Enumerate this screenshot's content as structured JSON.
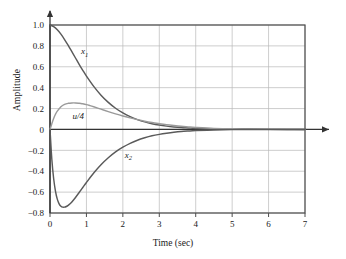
{
  "chart_data": {
    "type": "line",
    "title": "",
    "xlabel": "Time (sec)",
    "ylabel": "Amplitude",
    "xlim": [
      0,
      7
    ],
    "ylim": [
      -0.8,
      1.0
    ],
    "grid": true,
    "legend_position": "inline-annotations",
    "xticks": [
      "0",
      "1",
      "2",
      "3",
      "4",
      "5",
      "6",
      "7"
    ],
    "xtick_values": [
      0,
      1,
      2,
      3,
      4,
      5,
      6,
      7
    ],
    "yticks": [
      "1.0",
      "0.8",
      "0.6",
      "0.4",
      "0.2",
      "0",
      "−0.2",
      "−0.4",
      "−0.6",
      "−0.8"
    ],
    "ytick_values": [
      1.0,
      0.8,
      0.6,
      0.4,
      0.2,
      0,
      -0.2,
      -0.4,
      -0.6,
      -0.8
    ],
    "annotations": [
      {
        "text": "x",
        "sub": "1",
        "x": 0.85,
        "y": 0.72
      },
      {
        "text": "u/4",
        "sub": "",
        "x": 0.62,
        "y": 0.1
      },
      {
        "text": "x",
        "sub": "2",
        "x": 2.05,
        "y": -0.27
      }
    ],
    "series": [
      {
        "name": "x1",
        "color": "#5a5a5a",
        "x": [
          0,
          0.1,
          0.2,
          0.3,
          0.4,
          0.5,
          0.6,
          0.7,
          0.8,
          0.9,
          1.0,
          1.2,
          1.4,
          1.6,
          1.8,
          2.0,
          2.2,
          2.4,
          2.6,
          2.8,
          3.0,
          3.2,
          3.4,
          3.6,
          3.8,
          4.0,
          4.5,
          5.0,
          5.5,
          6.0,
          6.5,
          7.0
        ],
        "values": [
          1.0,
          0.985,
          0.955,
          0.912,
          0.861,
          0.804,
          0.744,
          0.684,
          0.624,
          0.566,
          0.511,
          0.412,
          0.328,
          0.259,
          0.203,
          0.158,
          0.122,
          0.094,
          0.072,
          0.055,
          0.042,
          0.032,
          0.024,
          0.018,
          0.014,
          0.01,
          0.005,
          0.002,
          0.001,
          0.0005,
          0.0002,
          0.0
        ]
      },
      {
        "name": "u/4",
        "color": "#9a9a9a",
        "x": [
          0,
          0.05,
          0.1,
          0.15,
          0.2,
          0.3,
          0.4,
          0.5,
          0.6,
          0.7,
          0.8,
          0.85,
          0.9,
          1.0,
          1.1,
          1.2,
          1.4,
          1.6,
          1.8,
          2.0,
          2.2,
          2.4,
          2.6,
          2.8,
          3.0,
          3.2,
          3.4,
          3.6,
          3.8,
          4.0,
          4.5,
          5.0,
          5.5,
          6.0,
          6.5,
          7.0
        ],
        "values": [
          0.0,
          0.055,
          0.105,
          0.145,
          0.175,
          0.218,
          0.24,
          0.25,
          0.254,
          0.254,
          0.251,
          0.249,
          0.246,
          0.238,
          0.228,
          0.217,
          0.194,
          0.171,
          0.149,
          0.129,
          0.111,
          0.094,
          0.079,
          0.066,
          0.055,
          0.045,
          0.037,
          0.03,
          0.024,
          0.019,
          0.01,
          0.005,
          0.003,
          0.0015,
          0.0007,
          0.0
        ]
      },
      {
        "name": "x2",
        "color": "#5a5a5a",
        "x": [
          0,
          0.05,
          0.1,
          0.15,
          0.2,
          0.25,
          0.3,
          0.35,
          0.4,
          0.45,
          0.5,
          0.55,
          0.6,
          0.7,
          0.8,
          0.9,
          1.0,
          1.2,
          1.4,
          1.6,
          1.8,
          2.0,
          2.2,
          2.4,
          2.6,
          2.8,
          3.0,
          3.2,
          3.4,
          3.6,
          3.8,
          4.0,
          4.5,
          5.0,
          5.5,
          6.0,
          6.5,
          7.0
        ],
        "values": [
          0.0,
          -0.285,
          -0.47,
          -0.59,
          -0.667,
          -0.712,
          -0.735,
          -0.744,
          -0.744,
          -0.738,
          -0.727,
          -0.712,
          -0.694,
          -0.651,
          -0.604,
          -0.556,
          -0.508,
          -0.417,
          -0.338,
          -0.271,
          -0.215,
          -0.17,
          -0.133,
          -0.103,
          -0.08,
          -0.061,
          -0.047,
          -0.036,
          -0.027,
          -0.02,
          -0.015,
          -0.011,
          -0.005,
          -0.002,
          -0.001,
          -0.0005,
          -0.0002,
          0.0
        ]
      }
    ]
  },
  "axes": {
    "y_axis_title": "Amplitude",
    "x_axis_title": "Time (sec)"
  }
}
